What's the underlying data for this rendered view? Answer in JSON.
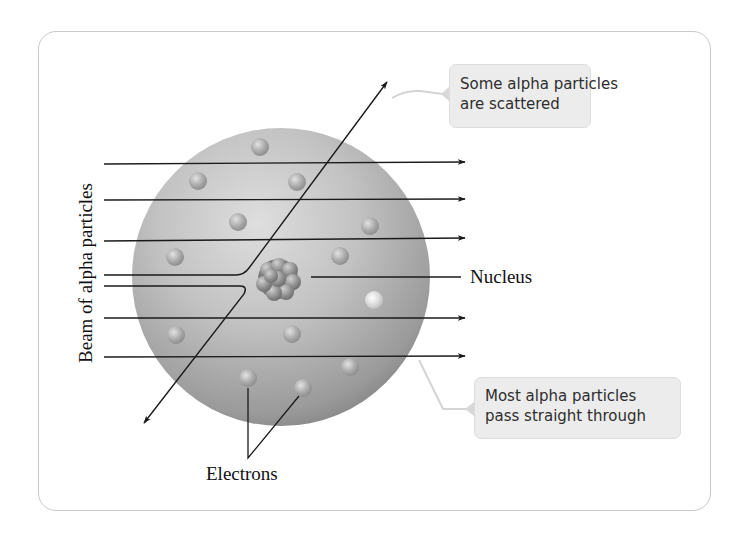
{
  "diagram": {
    "labels": {
      "beam": "Beam of alpha particles",
      "nucleus": "Nucleus",
      "electrons": "Electrons"
    },
    "callouts": {
      "scattered": {
        "line1": "Some alpha particles",
        "line2": "are scattered"
      },
      "pass_through": {
        "line1": "Most alpha particles",
        "line2": "pass straight through"
      }
    },
    "colors": {
      "frame_border": "#c9c9c9",
      "callout_fill": "#ececec",
      "callout_connector": "#d4d4d4",
      "atom_sphere": "#a9a9a9",
      "particle_path": "#1a1a1a",
      "label_text": "#111111"
    },
    "beam_count": 7,
    "electron_count": 14
  }
}
